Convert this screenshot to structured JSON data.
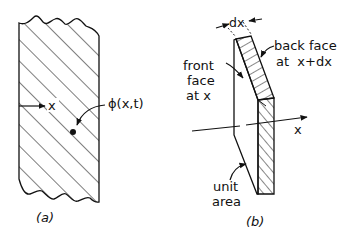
{
  "figure": {
    "panel_a": {
      "caption": "(a)",
      "axis_label": "x",
      "field_label": "ϕ(x,t)"
    },
    "panel_b": {
      "caption": "(b)",
      "width_label": "dx",
      "front_face_label": [
        "front",
        "face",
        "at x"
      ],
      "back_face_label": [
        "back face",
        "at  x+dx"
      ],
      "axis_label": "x",
      "area_label": [
        "unit",
        "area"
      ]
    },
    "colors": {
      "ink": "#111111",
      "background": "#ffffff"
    }
  }
}
